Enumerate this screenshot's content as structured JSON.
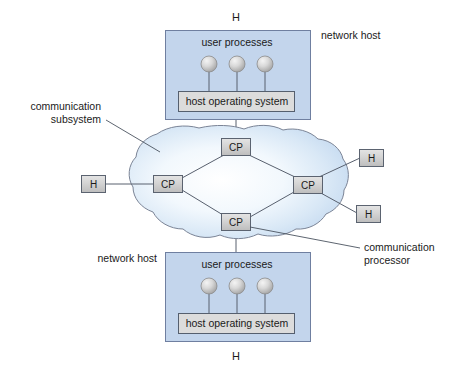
{
  "diagram": {
    "colors": {
      "host_fill": "#c3d5ec",
      "host_stroke": "#6f7fa0",
      "os_fill": "#dcdcdc",
      "os_stroke": "#555f6e",
      "gray_box_fill": "#d2d2d2",
      "gray_box_stroke": "#5b6370",
      "cloud_fill_center": "#fdfeff",
      "cloud_fill_edge": "#c6dbf0",
      "cloud_stroke": "#7b8496",
      "link_stroke": "#58606e",
      "text": "#1a1a1a",
      "background": "#ffffff"
    },
    "top_host": {
      "h_label": "H",
      "user_processes_label": "user processes",
      "os_label": "host operating system",
      "side_label": "network host",
      "process_count": 3
    },
    "bottom_host": {
      "h_label": "H",
      "user_processes_label": "user processes",
      "os_label": "host operating system",
      "side_label": "network host",
      "process_count": 3
    },
    "annotations": {
      "comm_subsystem_line1": "communication",
      "comm_subsystem_line2": "subsystem",
      "comm_processor_line1": "communication",
      "comm_processor_line2": "processor"
    },
    "comm_processors": [
      {
        "id": "cp-top",
        "label": "CP"
      },
      {
        "id": "cp-left",
        "label": "CP"
      },
      {
        "id": "cp-right",
        "label": "CP"
      },
      {
        "id": "cp-bottom",
        "label": "CP"
      }
    ],
    "edge_hosts": [
      {
        "id": "h-left",
        "label": "H"
      },
      {
        "id": "h-right-upper",
        "label": "H"
      },
      {
        "id": "h-right-lower",
        "label": "H"
      }
    ]
  }
}
